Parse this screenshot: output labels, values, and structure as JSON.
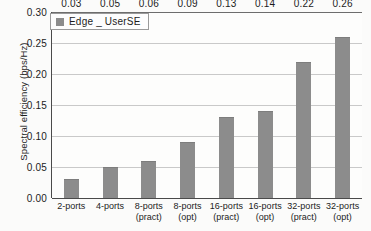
{
  "chart_data": {
    "type": "bar",
    "title": "",
    "xlabel": "",
    "ylabel": "Spectral efficiency (bps/Hz)",
    "ylim": [
      0,
      0.3
    ],
    "ytick_labels": [
      "0.00",
      "0.05",
      "0.10",
      "0.15",
      "0.20",
      "0.25",
      "0.30"
    ],
    "ytick_values": [
      0.0,
      0.05,
      0.1,
      0.15,
      0.2,
      0.25,
      0.3
    ],
    "grid": true,
    "legend_position": "top-left",
    "categories": [
      "2-ports",
      "4-ports",
      "8-ports (pract)",
      "8-ports (opt)",
      "16-ports (pract)",
      "16-ports (opt)",
      "32-ports (pract)",
      "32-ports (opt)"
    ],
    "category_lines": [
      {
        "line1": "2-ports",
        "line2": ""
      },
      {
        "line1": "4-ports",
        "line2": ""
      },
      {
        "line1": "8-ports",
        "line2": "(pract)"
      },
      {
        "line1": "8-ports",
        "line2": "(opt)"
      },
      {
        "line1": "16-ports",
        "line2": "(pract)"
      },
      {
        "line1": "16-ports",
        "line2": "(opt)"
      },
      {
        "line1": "32-ports",
        "line2": "(pract)"
      },
      {
        "line1": "32-ports",
        "line2": "(opt)"
      }
    ],
    "series": [
      {
        "name": "Edge _ UserSE",
        "values": [
          0.03,
          0.05,
          0.06,
          0.09,
          0.13,
          0.14,
          0.22,
          0.26
        ],
        "labels": [
          "0.03",
          "0.05",
          "0.06",
          "0.09",
          "0.13",
          "0.14",
          "0.22",
          "0.26"
        ],
        "color": "#8c8c8c"
      }
    ]
  },
  "legend": {
    "entries": [
      {
        "label": "Edge _ UserSE",
        "color": "#8c8c8c"
      }
    ]
  },
  "colors": {
    "bar": "#8c8c8c",
    "gridline": "#c9c9c9",
    "axis": "#4a4a4a",
    "text": "#1c1c1c",
    "background": "#fbfbfa"
  }
}
